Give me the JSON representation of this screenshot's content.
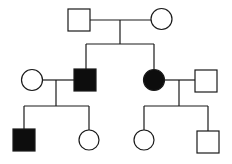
{
  "diagram": {
    "type": "pedigree",
    "colors": {
      "line": "#1a1a1a",
      "affected": "#0d0d0d",
      "unaffected": "#ffffff"
    },
    "generations": [
      {
        "id": "I",
        "members": [
          {
            "id": "I-1",
            "sex": "male",
            "affected": false
          },
          {
            "id": "I-2",
            "sex": "female",
            "affected": false
          }
        ]
      },
      {
        "id": "II",
        "members": [
          {
            "id": "II-1",
            "sex": "female",
            "affected": false,
            "note": "spouse of II-2"
          },
          {
            "id": "II-2",
            "sex": "male",
            "affected": true,
            "note": "child of I-1 x I-2"
          },
          {
            "id": "II-3",
            "sex": "female",
            "affected": true,
            "note": "child of I-1 x I-2"
          },
          {
            "id": "II-4",
            "sex": "male",
            "affected": false,
            "note": "spouse of II-3"
          }
        ]
      },
      {
        "id": "III",
        "members": [
          {
            "id": "III-1",
            "sex": "male",
            "affected": true,
            "note": "child of II-1 x II-2"
          },
          {
            "id": "III-2",
            "sex": "female",
            "affected": false,
            "note": "child of II-1 x II-2"
          },
          {
            "id": "III-3",
            "sex": "female",
            "affected": false,
            "note": "child of II-3 x II-4"
          },
          {
            "id": "III-4",
            "sex": "male",
            "affected": false,
            "note": "child of II-3 x II-4"
          }
        ]
      }
    ]
  }
}
